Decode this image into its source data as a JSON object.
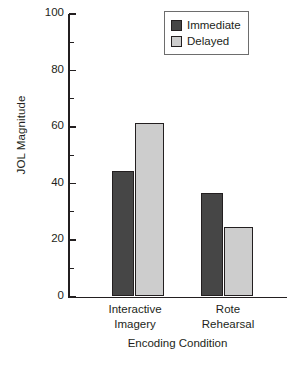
{
  "chart_data": {
    "type": "bar",
    "title": "",
    "xlabel": "Encoding Condition",
    "ylabel": "JOL Magnitude",
    "categories": [
      "Interactive Imagery",
      "Rote Rehearsal"
    ],
    "category_lines": [
      [
        "Interactive",
        "Imagery"
      ],
      [
        "Rote",
        "Rehearsal"
      ]
    ],
    "series": [
      {
        "name": "Immediate",
        "values": [
          44.5,
          36.5
        ],
        "color": "#464646"
      },
      {
        "name": "Delayed",
        "values": [
          61.5,
          24.5
        ],
        "color": "#cdcdcd"
      }
    ],
    "ylim": [
      0,
      100
    ],
    "yticks": [
      0,
      20,
      40,
      60,
      80,
      100
    ],
    "ytick_labels": [
      "0",
      "20",
      "40",
      "60",
      "80",
      "100"
    ],
    "yminor_ticks": [
      10,
      30,
      50,
      70,
      90
    ],
    "grid": false,
    "legend_position": "top-right",
    "legend_entries": [
      "Immediate",
      "Delayed"
    ]
  },
  "legend": {
    "items": [
      {
        "label": "Immediate"
      },
      {
        "label": "Delayed"
      }
    ]
  },
  "axes": {
    "y_title": "JOL Magnitude",
    "x_title": "Encoding Condition"
  }
}
